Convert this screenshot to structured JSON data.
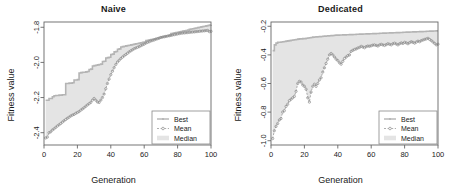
{
  "figure": {
    "width": 454,
    "height": 190,
    "background": "#ffffff",
    "panel_count": 2
  },
  "colors": {
    "best_line": "#b4b4b4",
    "mean_line": "#8c8c8c",
    "median_band": "#e4e4e4",
    "axis": "#666666",
    "text": "#1a1a1a",
    "legend_border": "#888888"
  },
  "legend": {
    "entries": [
      {
        "label": "Best",
        "style": "solid-line-with-point"
      },
      {
        "label": "Mean",
        "style": "dashed-line-with-circle"
      },
      {
        "label": "Median",
        "style": "filled-band"
      }
    ]
  },
  "chart_data": [
    {
      "type": "line",
      "title": "Naive",
      "xlabel": "Generation",
      "ylabel": "Fitness value",
      "xlim": [
        0,
        100
      ],
      "ylim": [
        -2.47,
        -1.77
      ],
      "xticks": [
        0,
        20,
        40,
        60,
        80,
        100
      ],
      "yticks": [
        -1.8,
        -2.0,
        -2.2,
        -2.4
      ],
      "ytick_labels": [
        "-1.8",
        "-2.0",
        "-2.2",
        "-2.4"
      ],
      "xtick_labels": [
        "0",
        "20",
        "40",
        "60",
        "80",
        "100"
      ],
      "grid": false,
      "legend_position": "bottom-right",
      "x": [
        1,
        2,
        3,
        4,
        5,
        6,
        7,
        8,
        9,
        10,
        11,
        12,
        13,
        14,
        15,
        16,
        17,
        18,
        19,
        20,
        21,
        22,
        23,
        24,
        25,
        26,
        27,
        28,
        29,
        30,
        31,
        32,
        33,
        34,
        35,
        36,
        37,
        38,
        39,
        40,
        41,
        42,
        43,
        44,
        45,
        46,
        47,
        48,
        49,
        50,
        51,
        52,
        53,
        54,
        55,
        56,
        57,
        58,
        59,
        60,
        61,
        62,
        63,
        64,
        65,
        66,
        67,
        68,
        69,
        70,
        71,
        72,
        73,
        74,
        75,
        76,
        77,
        78,
        79,
        80,
        81,
        82,
        83,
        84,
        85,
        86,
        87,
        88,
        89,
        90,
        91,
        92,
        93,
        94,
        95,
        96,
        97,
        98,
        99,
        100
      ],
      "series": [
        {
          "name": "Best",
          "style": "step",
          "values": [
            -2.215,
            -2.215,
            -2.205,
            -2.205,
            -2.195,
            -2.19,
            -2.188,
            -2.188,
            -2.186,
            -2.186,
            -2.184,
            -2.184,
            -2.12,
            -2.12,
            -2.118,
            -2.118,
            -2.116,
            -2.1,
            -2.1,
            -2.098,
            -2.06,
            -2.058,
            -2.056,
            -2.056,
            -2.054,
            -2.052,
            -2.04,
            -2.038,
            -2.02,
            -2.018,
            -2.016,
            -2.014,
            -2.012,
            -2.01,
            -1.995,
            -1.993,
            -1.975,
            -1.973,
            -1.971,
            -1.955,
            -1.953,
            -1.94,
            -1.938,
            -1.925,
            -1.923,
            -1.912,
            -1.91,
            -1.908,
            -1.906,
            -1.904,
            -1.902,
            -1.9,
            -1.898,
            -1.896,
            -1.894,
            -1.892,
            -1.89,
            -1.888,
            -1.886,
            -1.884,
            -1.876,
            -1.874,
            -1.872,
            -1.87,
            -1.868,
            -1.866,
            -1.864,
            -1.862,
            -1.858,
            -1.856,
            -1.854,
            -1.852,
            -1.85,
            -1.848,
            -1.846,
            -1.836,
            -1.834,
            -1.832,
            -1.83,
            -1.828,
            -1.826,
            -1.824,
            -1.822,
            -1.82,
            -1.818,
            -1.816,
            -1.812,
            -1.81,
            -1.808,
            -1.806,
            -1.804,
            -1.802,
            -1.8,
            -1.798,
            -1.796,
            -1.794,
            -1.792,
            -1.79,
            -1.788,
            -1.786
          ]
        },
        {
          "name": "Mean",
          "style": "dashed-points",
          "values": [
            -2.43,
            -2.425,
            -2.4,
            -2.395,
            -2.385,
            -2.378,
            -2.37,
            -2.362,
            -2.355,
            -2.348,
            -2.34,
            -2.332,
            -2.325,
            -2.318,
            -2.312,
            -2.305,
            -2.3,
            -2.296,
            -2.29,
            -2.285,
            -2.28,
            -2.272,
            -2.265,
            -2.258,
            -2.25,
            -2.242,
            -2.235,
            -2.228,
            -2.215,
            -2.205,
            -2.215,
            -2.225,
            -2.228,
            -2.215,
            -2.2,
            -2.18,
            -2.15,
            -2.12,
            -2.095,
            -2.07,
            -2.05,
            -2.03,
            -2.012,
            -1.998,
            -1.988,
            -1.978,
            -1.97,
            -1.962,
            -1.955,
            -1.948,
            -1.94,
            -1.934,
            -1.928,
            -1.922,
            -1.918,
            -1.914,
            -1.91,
            -1.905,
            -1.9,
            -1.896,
            -1.89,
            -1.886,
            -1.882,
            -1.878,
            -1.875,
            -1.872,
            -1.868,
            -1.865,
            -1.862,
            -1.858,
            -1.856,
            -1.854,
            -1.852,
            -1.85,
            -1.848,
            -1.846,
            -1.844,
            -1.842,
            -1.84,
            -1.838,
            -1.836,
            -1.834,
            -1.833,
            -1.832,
            -1.831,
            -1.83,
            -1.829,
            -1.828,
            -1.827,
            -1.826,
            -1.825,
            -1.824,
            -1.823,
            -1.822,
            -1.821,
            -1.82,
            -1.819,
            -1.818,
            -1.825,
            -1.823
          ]
        },
        {
          "name": "Median",
          "style": "band",
          "note": "shaded band between Best and Mean"
        }
      ]
    },
    {
      "type": "line",
      "title": "Dedicated",
      "xlabel": "Generation",
      "ylabel": "Fitness value",
      "xlim": [
        0,
        100
      ],
      "ylim": [
        -1.03,
        -0.17
      ],
      "xticks": [
        0,
        20,
        40,
        60,
        80,
        100
      ],
      "yticks": [
        -0.2,
        -0.4,
        -0.6,
        -0.8,
        -1.0
      ],
      "ytick_labels": [
        "-0.2",
        "-0.4",
        "-0.6",
        "-0.8",
        "-1.0"
      ],
      "xtick_labels": [
        "0",
        "20",
        "40",
        "60",
        "80",
        "100"
      ],
      "grid": false,
      "legend_position": "bottom-right",
      "x": [
        1,
        2,
        3,
        4,
        5,
        6,
        7,
        8,
        9,
        10,
        11,
        12,
        13,
        14,
        15,
        16,
        17,
        18,
        19,
        20,
        21,
        22,
        23,
        24,
        25,
        26,
        27,
        28,
        29,
        30,
        31,
        32,
        33,
        34,
        35,
        36,
        37,
        38,
        39,
        40,
        41,
        42,
        43,
        44,
        45,
        46,
        47,
        48,
        49,
        50,
        51,
        52,
        53,
        54,
        55,
        56,
        57,
        58,
        59,
        60,
        61,
        62,
        63,
        64,
        65,
        66,
        67,
        68,
        69,
        70,
        71,
        72,
        73,
        74,
        75,
        76,
        77,
        78,
        79,
        80,
        81,
        82,
        83,
        84,
        85,
        86,
        87,
        88,
        89,
        90,
        91,
        92,
        93,
        94,
        95,
        96,
        97,
        98,
        99,
        100
      ],
      "series": [
        {
          "name": "Best",
          "style": "step",
          "values": [
            -0.37,
            -0.33,
            -0.318,
            -0.312,
            -0.312,
            -0.31,
            -0.308,
            -0.306,
            -0.304,
            -0.302,
            -0.3,
            -0.298,
            -0.296,
            -0.294,
            -0.292,
            -0.29,
            -0.288,
            -0.288,
            -0.286,
            -0.286,
            -0.284,
            -0.282,
            -0.28,
            -0.278,
            -0.276,
            -0.275,
            -0.274,
            -0.273,
            -0.272,
            -0.271,
            -0.27,
            -0.269,
            -0.268,
            -0.267,
            -0.266,
            -0.265,
            -0.264,
            -0.263,
            -0.262,
            -0.262,
            -0.261,
            -0.261,
            -0.26,
            -0.26,
            -0.259,
            -0.259,
            -0.258,
            -0.258,
            -0.257,
            -0.257,
            -0.256,
            -0.256,
            -0.255,
            -0.255,
            -0.254,
            -0.254,
            -0.253,
            -0.253,
            -0.252,
            -0.252,
            -0.251,
            -0.251,
            -0.25,
            -0.25,
            -0.249,
            -0.249,
            -0.248,
            -0.248,
            -0.247,
            -0.247,
            -0.246,
            -0.246,
            -0.245,
            -0.245,
            -0.244,
            -0.244,
            -0.243,
            -0.243,
            -0.242,
            -0.242,
            -0.241,
            -0.241,
            -0.24,
            -0.24,
            -0.239,
            -0.239,
            -0.238,
            -0.238,
            -0.237,
            -0.237,
            -0.236,
            -0.236,
            -0.235,
            -0.235,
            -0.234,
            -0.234,
            -0.233,
            -0.233,
            -0.232,
            -0.232
          ]
        },
        {
          "name": "Mean",
          "style": "dashed-points",
          "values": [
            -0.985,
            -0.93,
            -0.9,
            -0.88,
            -0.855,
            -0.845,
            -0.8,
            -0.79,
            -0.76,
            -0.745,
            -0.72,
            -0.71,
            -0.7,
            -0.69,
            -0.655,
            -0.6,
            -0.585,
            -0.59,
            -0.61,
            -0.62,
            -0.64,
            -0.7,
            -0.73,
            -0.66,
            -0.62,
            -0.605,
            -0.62,
            -0.6,
            -0.575,
            -0.56,
            -0.52,
            -0.49,
            -0.46,
            -0.43,
            -0.4,
            -0.39,
            -0.4,
            -0.415,
            -0.43,
            -0.44,
            -0.455,
            -0.465,
            -0.445,
            -0.425,
            -0.415,
            -0.405,
            -0.4,
            -0.375,
            -0.368,
            -0.362,
            -0.358,
            -0.352,
            -0.348,
            -0.34,
            -0.345,
            -0.35,
            -0.342,
            -0.338,
            -0.34,
            -0.336,
            -0.332,
            -0.33,
            -0.334,
            -0.338,
            -0.33,
            -0.326,
            -0.33,
            -0.334,
            -0.328,
            -0.322,
            -0.326,
            -0.33,
            -0.322,
            -0.318,
            -0.324,
            -0.33,
            -0.322,
            -0.316,
            -0.32,
            -0.312,
            -0.316,
            -0.322,
            -0.314,
            -0.308,
            -0.312,
            -0.318,
            -0.31,
            -0.304,
            -0.308,
            -0.3,
            -0.296,
            -0.292,
            -0.288,
            -0.284,
            -0.292,
            -0.3,
            -0.31,
            -0.32,
            -0.33,
            -0.325
          ]
        },
        {
          "name": "Median",
          "style": "band",
          "note": "shaded band between Best and Mean"
        }
      ]
    }
  ]
}
